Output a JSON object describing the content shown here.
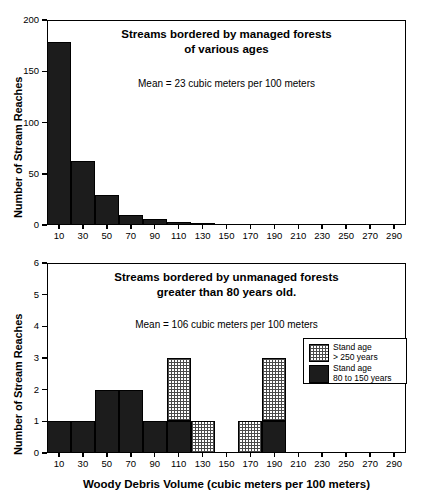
{
  "figure": {
    "background": "#ffffff",
    "bar_solid_color": "#1c1c1c",
    "bar_hatch_color": "#4a4a4a",
    "axis_color": "#000000"
  },
  "chart_data": [
    {
      "type": "bar",
      "id": "managed-forests-histogram",
      "title": "Streams bordered by managed forests\nof various ages",
      "title_line1": "Streams bordered by managed forests",
      "title_line2": "of various ages",
      "annotation": "Mean = 23 cubic meters per 100 meters",
      "xlabel": "",
      "ylabel": "Number of Stream Reaches",
      "ylim": [
        0,
        200
      ],
      "yticks": [
        0,
        50,
        100,
        150,
        200
      ],
      "ytick_labels": [
        "0",
        "50",
        "100",
        "150",
        "200"
      ],
      "xlim": [
        0,
        300
      ],
      "xticks": [
        10,
        30,
        50,
        70,
        90,
        110,
        130,
        150,
        170,
        190,
        210,
        230,
        250,
        270,
        290
      ],
      "xtick_labels": [
        "10",
        "30",
        "50",
        "70",
        "90",
        "110",
        "130",
        "150",
        "170",
        "190",
        "210",
        "230",
        "250",
        "270",
        "290"
      ],
      "grid": false,
      "legend": null,
      "categories": [
        10,
        30,
        50,
        70,
        90,
        110,
        130,
        150,
        170,
        190,
        210,
        230,
        250,
        270,
        290
      ],
      "values": [
        179,
        62,
        29,
        10,
        6,
        3,
        2,
        0,
        0,
        0,
        0,
        0,
        0,
        0,
        0
      ],
      "bin_width": 20
    },
    {
      "type": "bar",
      "id": "unmanaged-forests-histogram",
      "title": "Streams bordered by unmanaged forests\ngreater than 80 years old.",
      "title_line1": "Streams bordered by unmanaged forests",
      "title_line2": "greater than 80 years old.",
      "annotation": "Mean = 106 cubic meters per 100 meters",
      "xlabel": "Woody Debris Volume (cubic meters per 100 meters)",
      "ylabel": "Number of Stream Reaches",
      "ylim": [
        0,
        6
      ],
      "yticks": [
        0,
        1,
        2,
        3,
        4,
        5,
        6
      ],
      "ytick_labels": [
        "0",
        "1",
        "2",
        "3",
        "4",
        "5",
        "6"
      ],
      "xlim": [
        0,
        300
      ],
      "xticks": [
        10,
        30,
        50,
        70,
        90,
        110,
        130,
        150,
        170,
        190,
        210,
        230,
        250,
        270,
        290
      ],
      "xtick_labels": [
        "10",
        "30",
        "50",
        "70",
        "90",
        "110",
        "130",
        "150",
        "170",
        "190",
        "210",
        "230",
        "250",
        "270",
        "290"
      ],
      "grid": false,
      "stacked": true,
      "bin_width": 20,
      "categories": [
        10,
        30,
        50,
        70,
        90,
        110,
        130,
        150,
        170,
        190,
        210,
        230,
        250,
        270,
        290
      ],
      "series": [
        {
          "name": "Stand age 80 to 150 years",
          "fill": "solid",
          "values": [
            1,
            1,
            2,
            2,
            1,
            1,
            0,
            0,
            0,
            1,
            0,
            0,
            0,
            0,
            0
          ]
        },
        {
          "name": "Stand age > 250 years",
          "fill": "hatch",
          "values": [
            0,
            0,
            0,
            0,
            0,
            2,
            1,
            0,
            1,
            2,
            0,
            0,
            0,
            0,
            0
          ]
        }
      ],
      "legend": {
        "position": "upper right",
        "entries": [
          {
            "fill": "hatch",
            "line1": "Stand age",
            "line2": "> 250 years"
          },
          {
            "fill": "solid",
            "line1": "Stand age",
            "line2": "80 to 150 years"
          }
        ]
      }
    }
  ]
}
